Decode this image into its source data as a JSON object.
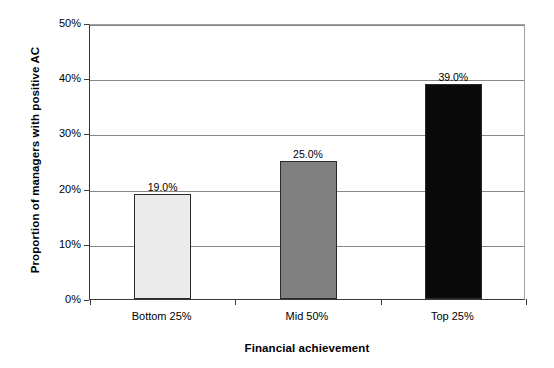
{
  "chart_data": {
    "type": "bar",
    "title": "",
    "categories": [
      "Bottom 25%",
      "Mid 50%",
      "Top 25%"
    ],
    "values": [
      19.0,
      25.0,
      39.0
    ],
    "value_labels": [
      "19.0%",
      "25.0%",
      "39.0%"
    ],
    "series": [
      {
        "name": "Proportion of managers with positive AC",
        "values": [
          19.0,
          25.0,
          39.0
        ]
      }
    ],
    "xlabel": "Financial achievement",
    "ylabel": "Proportion of managers with positive AC",
    "ylim": [
      0,
      50
    ],
    "yticks": [
      0,
      10,
      20,
      30,
      40,
      50
    ],
    "ytick_labels": [
      "0%",
      "10%",
      "20%",
      "30%",
      "40%",
      "50%"
    ],
    "grid": true,
    "grid_axis": "y",
    "legend": false,
    "legend_position": "none",
    "bar_colors": [
      "#ebebeb",
      "#808080",
      "#0a0a0a"
    ],
    "bar_edge_color": "#2a2a2a",
    "gridline_color": "#888888",
    "axis_color": "#3a3a3a",
    "background_color": "#ffffff"
  },
  "axes": {
    "y_title": "Proportion of managers with positive AC",
    "x_title": "Financial achievement"
  }
}
